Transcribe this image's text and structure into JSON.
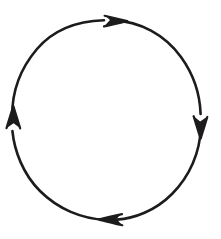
{
  "canvas": {
    "width": 221,
    "height": 239,
    "background_color": "#ffffff",
    "title": "Clockwise circular arrow cycle diagram"
  },
  "diagram": {
    "type": "circular-arrow-cycle",
    "style": "hand-drawn ink sketch",
    "direction": "clockwise",
    "stroke_color": "#1c1c1c",
    "stroke_width": 2.6,
    "fill_color": "none",
    "labels": [],
    "circle": {
      "center_x": 107,
      "center_y": 120,
      "radius_x": 96,
      "radius_y": 100,
      "bounds": {
        "left": 11,
        "top": 20,
        "right": 203,
        "bottom": 220
      }
    },
    "arrowheads": [
      {
        "name": "top-arrowhead",
        "position": "top",
        "points_toward": "right",
        "angle_degrees": 0,
        "tip_x": 126,
        "tip_y": 21
      },
      {
        "name": "right-arrowhead",
        "position": "right",
        "points_toward": "down",
        "angle_degrees": 90,
        "tip_x": 201,
        "tip_y": 137
      },
      {
        "name": "bottom-arrowhead",
        "position": "bottom",
        "points_toward": "left",
        "angle_degrees": 180,
        "tip_x": 100,
        "tip_y": 219
      },
      {
        "name": "left-arrowhead",
        "position": "left",
        "points_toward": "up",
        "angle_degrees": 270,
        "tip_x": 14,
        "tip_y": 107
      }
    ]
  }
}
